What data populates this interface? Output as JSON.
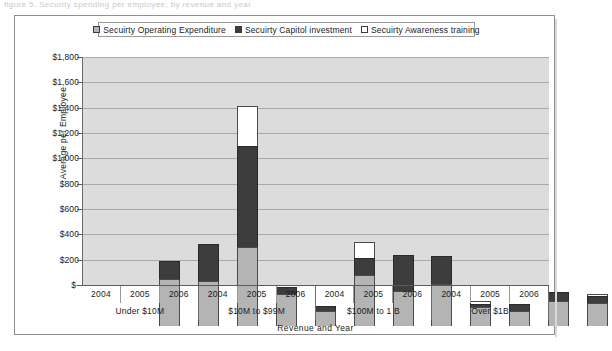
{
  "page": {
    "top_bleed_text": "figure 5. Security spending per employee, by revenue and year"
  },
  "chart_data": {
    "type": "bar",
    "stacked": true,
    "title": "",
    "xlabel": "Revenue and Year",
    "ylabel": "Average per Employee",
    "ylim": [
      0,
      1800
    ],
    "ytick_labels": [
      "$1,800",
      "$1,600",
      "$1,400",
      "$1,200",
      "$1,000",
      "$800",
      "$600",
      "$400",
      "$200",
      "$-"
    ],
    "ytick_values": [
      1800,
      1600,
      1400,
      1200,
      1000,
      800,
      600,
      400,
      200,
      0
    ],
    "grid": true,
    "legend_position": "top",
    "plot_background": "#dcdcdc",
    "groups": [
      {
        "label": "Under $10M",
        "years": [
          "2004",
          "2005",
          "2006"
        ]
      },
      {
        "label": "$10M to $99M",
        "years": [
          "2004",
          "2005",
          "2006"
        ]
      },
      {
        "label": "$100M to 1 B",
        "years": [
          "2004",
          "2005",
          "2006"
        ]
      },
      {
        "label": "Over $1B",
        "years": [
          "2004",
          "2005",
          "2006"
        ]
      }
    ],
    "categories": [
      "Under $10M 2004",
      "Under $10M 2005",
      "Under $10M 2006",
      "$10M to $99M 2004",
      "$10M to $99M 2005",
      "$10M to $99M 2006",
      "$100M to 1 B 2004",
      "$100M to 1 B 2005",
      "$100M to 1 B 2006",
      "Over $1B 2004",
      "Over $1B 2005",
      "Over $1B 2006"
    ],
    "series": [
      {
        "name": "Secuirty Operating Expenditure",
        "color": "#b4b4b4",
        "values": [
          370,
          358,
          621,
          255,
          120,
          400,
          280,
          330,
          150,
          120,
          195,
          185
        ]
      },
      {
        "name": "Secuirty Capitol investment",
        "color": "#3d3d3d",
        "values": [
          145,
          287,
          804,
          55,
          40,
          140,
          280,
          225,
          25,
          55,
          75,
          55
        ]
      },
      {
        "name": "Secuirty Awareness training",
        "color": "#ffffff",
        "values": [
          0,
          0,
          310,
          0,
          0,
          125,
          0,
          0,
          20,
          0,
          0,
          15
        ]
      }
    ],
    "totals": [
      515,
      645,
      1735,
      310,
      160,
      665,
      560,
      555,
      195,
      175,
      270,
      255
    ]
  },
  "legend": {
    "items": [
      {
        "label": "Secuirty Operating Expenditure",
        "swatch": "operating"
      },
      {
        "label": "Secuirty Capitol investment",
        "swatch": "capitol"
      },
      {
        "label": "Secuirty Awareness training",
        "swatch": "awareness"
      }
    ]
  }
}
